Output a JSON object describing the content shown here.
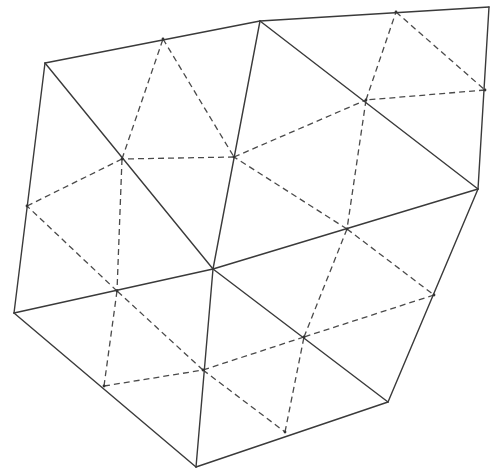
{
  "diagram": {
    "title": "",
    "width": 498,
    "height": 473,
    "colors": {
      "solid": "#3a3a3a",
      "dashed": "#4a4a4a",
      "background": "#ffffff"
    },
    "vertices": {
      "A": [
        45,
        63
      ],
      "B": [
        260,
        21
      ],
      "C": [
        489,
        7
      ],
      "D": [
        478,
        189
      ],
      "E": [
        213,
        269
      ],
      "F": [
        14,
        313
      ],
      "G": [
        196,
        467
      ],
      "H": [
        388,
        402
      ]
    },
    "midpoints": {
      "AB": [
        163,
        39
      ],
      "BC": [
        396,
        12
      ],
      "CD": [
        485,
        90
      ],
      "AE": [
        122,
        159
      ],
      "BE": [
        234,
        157
      ],
      "BD": [
        366,
        100
      ],
      "AF": [
        27,
        206
      ],
      "FE": [
        117,
        291
      ],
      "ED": [
        347,
        229
      ],
      "FG": [
        104,
        386
      ],
      "EG": [
        203,
        370
      ],
      "EH": [
        304,
        337
      ],
      "GH": [
        285,
        432
      ],
      "DH": [
        434,
        295
      ]
    },
    "solid_edges": [
      [
        "A",
        "B"
      ],
      [
        "B",
        "C"
      ],
      [
        "C",
        "D"
      ],
      [
        "A",
        "F"
      ],
      [
        "A",
        "E"
      ],
      [
        "B",
        "E"
      ],
      [
        "B",
        "D"
      ],
      [
        "E",
        "D"
      ],
      [
        "F",
        "E"
      ],
      [
        "F",
        "G"
      ],
      [
        "E",
        "G"
      ],
      [
        "E",
        "H"
      ],
      [
        "G",
        "H"
      ],
      [
        "D",
        "H"
      ]
    ],
    "coarse_triangles": [
      [
        "A",
        "B",
        "E"
      ],
      [
        "B",
        "C",
        "D"
      ],
      [
        "B",
        "D",
        "E"
      ],
      [
        "A",
        "F",
        "E"
      ],
      [
        "F",
        "G",
        "E"
      ],
      [
        "E",
        "G",
        "H"
      ],
      [
        "E",
        "D",
        "H"
      ]
    ],
    "dashed_triangles": [
      [
        "AB",
        "BE",
        "AE"
      ],
      [
        "BC",
        "CD",
        "BD"
      ],
      [
        "BD",
        "ED",
        "BE"
      ],
      [
        "AE",
        "FE",
        "AF"
      ],
      [
        "FG",
        "EG",
        "FE"
      ],
      [
        "EG",
        "GH",
        "EH"
      ],
      [
        "ED",
        "DH",
        "EH"
      ]
    ]
  }
}
